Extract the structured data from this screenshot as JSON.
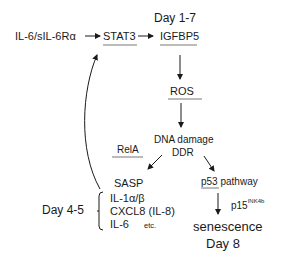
{
  "diagram": {
    "header_day": "Day 1-7",
    "ligand": "IL-6/sIL-6Rα",
    "nodes": {
      "stat3": "STAT3",
      "igfbp5": "IGFBP5",
      "ros": "ROS",
      "dna_damage": "DNA damage",
      "ddr": "DDR",
      "rela": "RelA",
      "sasp": "SASP",
      "p53": "p53",
      "p53_suffix": "pathway",
      "p15": "p15",
      "p15_sup": "INK4b",
      "senescence": "senescence",
      "senescence_day": "Day 8"
    },
    "sasp_list": {
      "item1": "IL-1α/β",
      "item2": "CXCL8 (IL-8)",
      "item3": "IL-6",
      "item3_suffix": "etc."
    },
    "feedback_day": "Day 4-5",
    "edges": [
      {
        "from": "IL-6/sIL-6Rα",
        "to": "STAT3"
      },
      {
        "from": "STAT3",
        "to": "IGFBP5"
      },
      {
        "from": "IGFBP5",
        "to": "ROS"
      },
      {
        "from": "ROS",
        "to": "DNA damage / DDR"
      },
      {
        "from": "DNA damage / DDR",
        "to": "SASP",
        "label": "RelA"
      },
      {
        "from": "DNA damage / DDR",
        "to": "p53 pathway"
      },
      {
        "from": "p53 pathway",
        "to": "senescence",
        "label": "p15INK4b"
      },
      {
        "from": "SASP",
        "to": "STAT3",
        "type": "feedback"
      }
    ]
  }
}
